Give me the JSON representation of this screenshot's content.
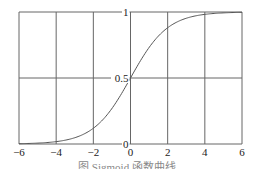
{
  "caption": "图  Sigmoid 函数曲线",
  "chart_data": {
    "type": "line",
    "title": "",
    "xlabel": "",
    "ylabel": "",
    "xlim": [
      -6,
      6
    ],
    "ylim": [
      0,
      1
    ],
    "grid": true,
    "x_ticks": [
      -6,
      -4,
      -2,
      0,
      2,
      4,
      6
    ],
    "y_ticks": [
      0,
      0.5,
      1
    ],
    "x_tick_labels": [
      "−6",
      "−4",
      "−2",
      "0",
      "2",
      "4",
      "6"
    ],
    "y_tick_labels": [
      "0",
      "0.5",
      "1"
    ],
    "y_axis_position": "x=0 (center)",
    "series": [
      {
        "name": "sigmoid",
        "function": "1/(1+exp(-x))",
        "x": [
          -6,
          -5,
          -4,
          -3,
          -2,
          -1,
          0,
          1,
          2,
          3,
          4,
          5,
          6
        ],
        "values": [
          0.0025,
          0.0067,
          0.018,
          0.047,
          0.119,
          0.269,
          0.5,
          0.731,
          0.881,
          0.953,
          0.982,
          0.993,
          0.9975
        ],
        "color": "#555555"
      }
    ],
    "legend": null
  }
}
